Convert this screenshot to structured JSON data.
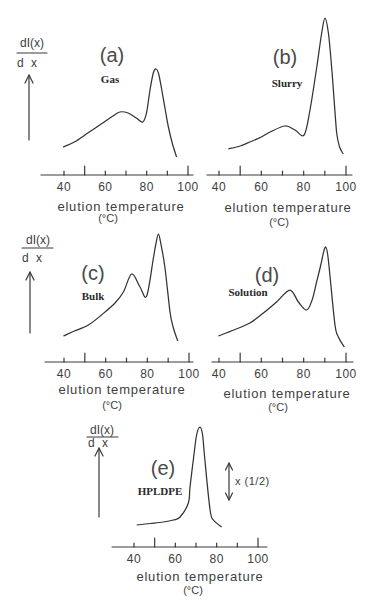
{
  "chart_data": [
    {
      "type": "line",
      "panel_label": "(a)",
      "title": "Gas",
      "xlabel": "elution temperature",
      "xunit": "(°C)",
      "ylabel": "dI(x)/dx",
      "ylabel_num": "dI(x)",
      "ylabel_den": "d x",
      "xlim": [
        29,
        102
      ],
      "xticks": [
        40,
        50,
        60,
        70,
        80,
        90,
        100
      ],
      "major_ticks": [
        50,
        100
      ],
      "xticklabels": [
        "40",
        "60",
        "80",
        "100"
      ],
      "grid": false,
      "x": [
        39.5,
        45,
        51.5,
        58,
        63,
        67,
        71,
        75,
        78.2,
        80,
        81.6,
        83.2,
        84.5,
        85.8,
        87.3,
        89,
        90.5,
        92.5,
        94.5
      ],
      "y": [
        0.28,
        0.33,
        0.42,
        0.51,
        0.58,
        0.63,
        0.62,
        0.57,
        0.53,
        0.63,
        0.85,
        1.02,
        1.06,
        1.01,
        0.85,
        0.65,
        0.48,
        0.31,
        0.18
      ]
    },
    {
      "type": "line",
      "panel_label": "(b)",
      "title": "Slurry",
      "xlabel": "elution temperature",
      "xunit": "(°C)",
      "xlim": [
        34,
        103
      ],
      "xticks": [
        40,
        50,
        60,
        70,
        80,
        90,
        100
      ],
      "major_ticks": [
        50,
        100
      ],
      "xticklabels": [
        "40",
        "60",
        "80",
        "100"
      ],
      "grid": false,
      "x": [
        44.4,
        50,
        54.6,
        60,
        64.1,
        71.2,
        75.9,
        80.2,
        83,
        86.2,
        88.5,
        90.1,
        91.7,
        93.2,
        94.4,
        95.6,
        97,
        98.7
      ],
      "y": [
        0.26,
        0.29,
        0.33,
        0.38,
        0.43,
        0.49,
        0.45,
        0.4,
        0.65,
        1.08,
        1.42,
        1.57,
        1.42,
        1.08,
        0.75,
        0.42,
        0.28,
        0.21
      ]
    },
    {
      "type": "line",
      "panel_label": "(c)",
      "title": "Bulk",
      "xlabel": "elution temperature",
      "xunit": "(°C)",
      "ylabel": "dI(x)/dx",
      "ylabel_num": "dI(x)",
      "ylabel_den": "d x",
      "xlim": [
        31,
        102
      ],
      "xticks": [
        40,
        50,
        60,
        70,
        80,
        90,
        100
      ],
      "major_ticks": [
        50,
        100
      ],
      "xticklabels": [
        "40",
        "60",
        "80",
        "100"
      ],
      "grid": false,
      "x": [
        39.7,
        45,
        51.7,
        58,
        64.5,
        68.5,
        72.5,
        76.5,
        79.7,
        82.9,
        84,
        85.3,
        86.6,
        88.5,
        90.9,
        92.5,
        94.6
      ],
      "y": [
        0.26,
        0.31,
        0.37,
        0.47,
        0.59,
        0.7,
        0.88,
        0.75,
        0.66,
        1.04,
        1.17,
        1.28,
        1.17,
        0.94,
        0.5,
        0.34,
        0.21
      ]
    },
    {
      "type": "line",
      "panel_label": "(d)",
      "title": "Solution",
      "xlabel": "elution temperature",
      "xunit": "(°C)",
      "xlim": [
        37,
        103
      ],
      "xticks": [
        40,
        50,
        60,
        70,
        80,
        90,
        100
      ],
      "major_ticks": [
        50,
        100
      ],
      "xticklabels": [
        "40",
        "60",
        "80",
        "100"
      ],
      "grid": false,
      "x": [
        39.7,
        47,
        54.6,
        61,
        67.2,
        73.5,
        77.5,
        81.4,
        84,
        86.1,
        88.2,
        89.4,
        90.4,
        91.3,
        92.4,
        94.8,
        96.4,
        99.2
      ],
      "y": [
        0.26,
        0.32,
        0.39,
        0.49,
        0.6,
        0.72,
        0.6,
        0.52,
        0.62,
        0.8,
        0.98,
        1.1,
        1.15,
        1.08,
        0.87,
        0.37,
        0.25,
        0.15
      ]
    },
    {
      "type": "line",
      "panel_label": "(e)",
      "title": "HPLDPE",
      "xlabel": "elution temperature",
      "xunit": "(°C)",
      "ylabel": "dI(x)/dx",
      "ylabel_num": "dI(x)",
      "ylabel_den": "d x",
      "annotation": "x (1/2)",
      "xlim": [
        29,
        104
      ],
      "xticks": [
        40,
        50,
        60,
        70,
        80,
        90,
        100
      ],
      "major_ticks": [
        50,
        100
      ],
      "xticklabels": [
        "40",
        "60",
        "80",
        "100"
      ],
      "grid": false,
      "x": [
        41.3,
        48,
        54.2,
        59,
        62.3,
        66.3,
        67.1,
        68.7,
        70.3,
        71.9,
        73.2,
        74.3,
        76.8,
        78.4,
        82.4
      ],
      "y": [
        0.22,
        0.235,
        0.25,
        0.27,
        0.3,
        0.44,
        0.6,
        0.87,
        1.12,
        1.2,
        1.12,
        0.87,
        0.37,
        0.27,
        0.2
      ]
    }
  ]
}
